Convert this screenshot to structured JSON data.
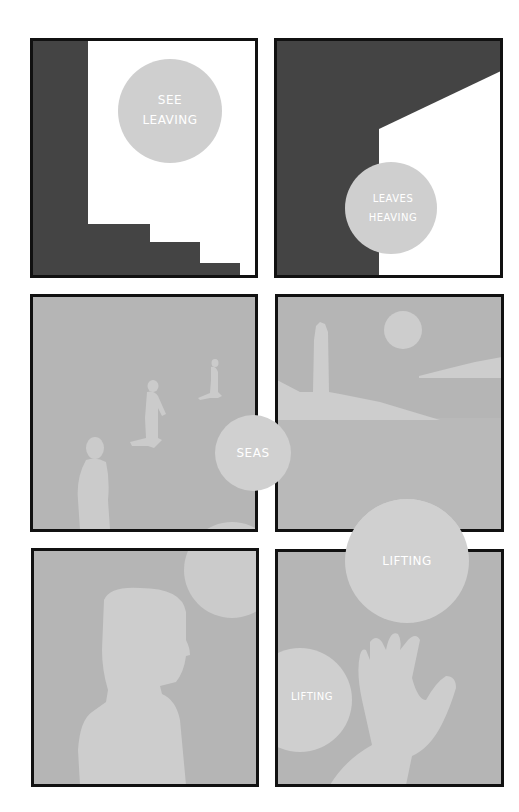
{
  "page": {
    "background": "#ffffff",
    "border_color": "#111111",
    "dark_fill": "#444444",
    "panel_gray": "#b5b5b5",
    "silhouette_gray": "#cdcdcd",
    "bubble_gray": "#cfcfcf",
    "caption_color": "#ffffff"
  },
  "panels": [
    {
      "id": 1,
      "scene": "dark stairs and white wall",
      "captions": [
        {
          "lines": [
            "SEE",
            "LEAVING"
          ]
        }
      ]
    },
    {
      "id": 2,
      "scene": "dark room with white angled opening",
      "captions": [
        {
          "lines": [
            "LEAVES",
            "HEAVING"
          ]
        }
      ]
    },
    {
      "id": 3,
      "scene": "figures walking on beach",
      "captions": [
        {
          "lines": [
            "SEAS"
          ]
        }
      ]
    },
    {
      "id": 4,
      "scene": "lighthouse on island with moon",
      "captions": []
    },
    {
      "id": 5,
      "scene": "silhouette of a person in profile",
      "captions": []
    },
    {
      "id": 6,
      "scene": "hand reaching up",
      "captions": [
        {
          "lines": [
            "LIFTING"
          ]
        },
        {
          "lines": [
            "LIFTING"
          ]
        }
      ]
    }
  ]
}
